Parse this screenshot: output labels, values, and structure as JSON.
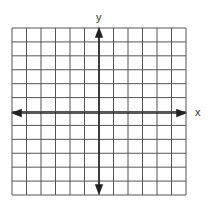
{
  "diagram": {
    "type": "coordinate-grid",
    "x_axis_label": "x",
    "y_axis_label": "y",
    "grid": {
      "columns": 12,
      "rows": 12,
      "left": 12,
      "top": 28,
      "right": 186,
      "bottom": 195
    },
    "origin": {
      "col": 6,
      "row": 6
    },
    "colors": {
      "grid": "#444444",
      "axis": "#222222",
      "background": "#ffffff"
    }
  }
}
